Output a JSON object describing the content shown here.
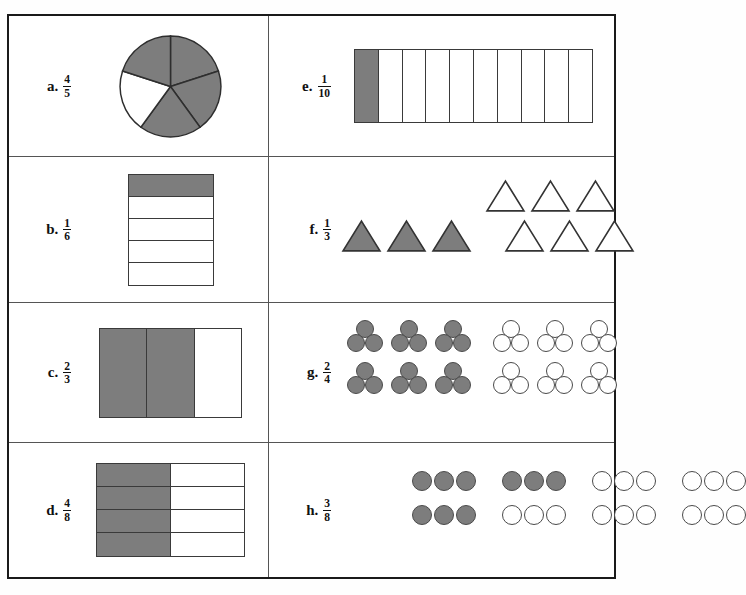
{
  "worksheet": {
    "title": "Fraction Models Worksheet",
    "shade_color": "#7d7d7d",
    "blank_color": "#ffffff",
    "outline_color": "#3a3a3a",
    "border_color": "#1a1a1a"
  },
  "items": [
    {
      "key": "a",
      "letter": "a.",
      "numerator": "4",
      "denominator": "5",
      "fraction": "4/5",
      "model": "pie",
      "total_parts": 5,
      "shaded_parts": 4,
      "unshaded_parts": 1,
      "sectors": [
        {
          "index": 0,
          "start_deg": -90,
          "end_deg": -18,
          "shaded": true
        },
        {
          "index": 1,
          "start_deg": -18,
          "end_deg": 54,
          "shaded": true
        },
        {
          "index": 2,
          "start_deg": 54,
          "end_deg": 126,
          "shaded": true
        },
        {
          "index": 3,
          "start_deg": 126,
          "end_deg": 198,
          "shaded": false
        },
        {
          "index": 4,
          "start_deg": 198,
          "end_deg": 270,
          "shaded": true
        }
      ]
    },
    {
      "key": "b",
      "letter": "b.",
      "numerator": "1",
      "denominator": "6",
      "fraction": "1/6",
      "model": "vertical-bar",
      "total_parts": 5,
      "shaded_parts": 1,
      "unshaded_parts": 4,
      "cells": [
        true,
        false,
        false,
        false,
        false
      ]
    },
    {
      "key": "c",
      "letter": "c.",
      "numerator": "2",
      "denominator": "3",
      "fraction": "2/3",
      "model": "horizontal-columns",
      "total_parts": 3,
      "shaded_parts": 2,
      "unshaded_parts": 1,
      "cells": [
        true,
        true,
        false
      ]
    },
    {
      "key": "d",
      "letter": "d.",
      "numerator": "4",
      "denominator": "8",
      "fraction": "4/8",
      "model": "grid-2x4",
      "total_parts": 8,
      "shaded_parts": 4,
      "unshaded_parts": 4,
      "cells": [
        true,
        false,
        true,
        false,
        true,
        false,
        true,
        false
      ]
    },
    {
      "key": "e",
      "letter": "e.",
      "numerator": "1",
      "denominator": "10",
      "fraction": "1/10",
      "model": "horizontal-bar",
      "total_parts": 10,
      "shaded_parts": 1,
      "unshaded_parts": 9,
      "cells": [
        true,
        false,
        false,
        false,
        false,
        false,
        false,
        false,
        false,
        false
      ]
    },
    {
      "key": "f",
      "letter": "f.",
      "numerator": "1",
      "denominator": "3",
      "fraction": "1/3",
      "model": "triangle-set",
      "total_shapes": 9,
      "shaded_shapes": 3,
      "unshaded_shapes": 6,
      "top_row": [
        false,
        false,
        false
      ],
      "bottom_row_left": [
        true,
        true,
        true
      ],
      "bottom_row_right": [
        false,
        false,
        false
      ]
    },
    {
      "key": "g",
      "letter": "g.",
      "numerator": "2",
      "denominator": "4",
      "fraction": "2/4",
      "model": "circle-groups",
      "total_groups": 4,
      "shaded_groups": 2,
      "unshaded_groups": 2,
      "clusters_per_group": 6,
      "circles_per_cluster": 3,
      "groups": [
        {
          "position": "top-left",
          "shaded": true
        },
        {
          "position": "top-right",
          "shaded": false
        },
        {
          "position": "bottom-left",
          "shaded": true
        },
        {
          "position": "bottom-right",
          "shaded": false
        }
      ]
    },
    {
      "key": "h",
      "letter": "h.",
      "numerator": "3",
      "denominator": "8",
      "fraction": "3/8",
      "model": "circle-triplets",
      "total_groups": 8,
      "shaded_groups": 3,
      "unshaded_groups": 5,
      "circles_per_group": 3,
      "rows": [
        [
          true,
          true,
          false,
          false
        ],
        [
          true,
          false,
          false,
          false
        ]
      ]
    }
  ]
}
